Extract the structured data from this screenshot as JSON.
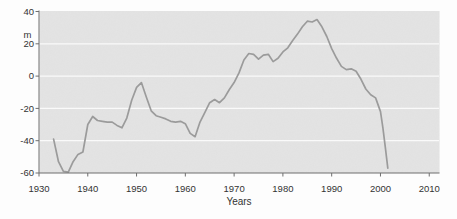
{
  "chart_data": {
    "type": "line",
    "title": "",
    "xlabel": "Years",
    "ylabel_unit": "m",
    "xlim": [
      1930,
      2012
    ],
    "ylim": [
      -60,
      40
    ],
    "xticks": [
      1930,
      1940,
      1950,
      1960,
      1970,
      1980,
      1990,
      2000,
      2010
    ],
    "yticks": [
      40,
      20,
      0,
      -20,
      -40,
      -60
    ],
    "gridlines": [
      20,
      0,
      -20,
      -40
    ],
    "grid": "horizontal-white-lines-on-gray-panel",
    "legend": "none",
    "series": [
      {
        "name": "level",
        "x": [
          1933,
          1934,
          1935,
          1936,
          1937,
          1938,
          1939,
          1940,
          1941,
          1942,
          1943,
          1944,
          1945,
          1946,
          1947,
          1948,
          1949,
          1950,
          1951,
          1952,
          1953,
          1954,
          1955,
          1956,
          1957,
          1958,
          1959,
          1960,
          1961,
          1962,
          1963,
          1964,
          1965,
          1966,
          1967,
          1968,
          1969,
          1970,
          1971,
          1972,
          1973,
          1974,
          1975,
          1976,
          1977,
          1978,
          1979,
          1980,
          1981,
          1982,
          1983,
          1984,
          1985,
          1986,
          1987,
          1988,
          1989,
          1990,
          1991,
          1992,
          1993,
          1994,
          1995,
          1996,
          1997,
          1998,
          1999,
          2000,
          2000.5,
          2001,
          2001.5
        ],
        "values": [
          -39,
          -53,
          -59,
          -59.5,
          -53,
          -48.5,
          -47,
          -30,
          -25,
          -27.5,
          -28,
          -28.5,
          -28.5,
          -30.5,
          -32,
          -26,
          -15,
          -7,
          -4,
          -13,
          -21.5,
          -24.5,
          -25.5,
          -26.5,
          -28,
          -28.5,
          -28,
          -29.5,
          -35.5,
          -37.5,
          -28.5,
          -22.5,
          -16.5,
          -14.5,
          -16.5,
          -13.5,
          -8.5,
          -4,
          2,
          10,
          14,
          13.5,
          10.5,
          13,
          13.5,
          9,
          11,
          15,
          17.5,
          22,
          26,
          30.5,
          34,
          33.5,
          35,
          30.5,
          24.5,
          17,
          11,
          6,
          4,
          4.5,
          3,
          -2,
          -8,
          -11.5,
          -13.5,
          -22,
          -32,
          -44,
          -57
        ]
      }
    ],
    "colors": {
      "page_background": "#fdfdfd",
      "plot_background": "#e4e4e4",
      "gridline": "#fafafa",
      "line": "#9b9b9b",
      "axis": "#6e6e6e",
      "text": "#333333"
    }
  }
}
